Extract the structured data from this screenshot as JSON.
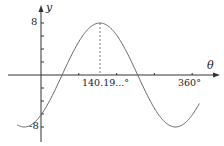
{
  "chart_data": {
    "type": "line",
    "title": "",
    "xlabel": "θ",
    "ylabel": "y",
    "function": "y = 8 sin(θ − 50.19°)",
    "amplitude": 8,
    "phase_shift_deg": 50.19,
    "xlim": [
      -57,
      378
    ],
    "ylim": [
      -9.5,
      9.5
    ],
    "x_ticks": [
      {
        "value": 140.19,
        "label": "140.19...°"
      },
      {
        "value": 360,
        "label": "360°"
      }
    ],
    "y_ticks": [
      {
        "value": 8,
        "label": "8"
      },
      {
        "value": -8,
        "label": "-8"
      }
    ],
    "annotations": [
      {
        "type": "dashed-vertical",
        "x": 140.19,
        "y_from": 0,
        "y_to": 8
      }
    ],
    "series": [
      {
        "name": "y = 8 sin(θ − 50.19°)",
        "x": [
          -57,
          -39.81,
          0,
          50.19,
          95.19,
          140.19,
          185.19,
          230.19,
          275.19,
          320.19,
          360,
          378
        ],
        "values": [
          -7.96,
          -8,
          -6.15,
          0,
          5.66,
          8,
          5.66,
          0,
          -5.66,
          -8,
          -6.15,
          -3.8
        ]
      }
    ],
    "grid": false,
    "legend": "none"
  },
  "labels": {
    "y_axis": "y",
    "x_axis": "θ",
    "y_max": "8",
    "y_min": "-8",
    "x_peak": "140.19...°",
    "x_end": "360°"
  },
  "colors": {
    "axis": "#333333",
    "curve": "#555555",
    "dashed": "#777777",
    "text": "#222222"
  }
}
